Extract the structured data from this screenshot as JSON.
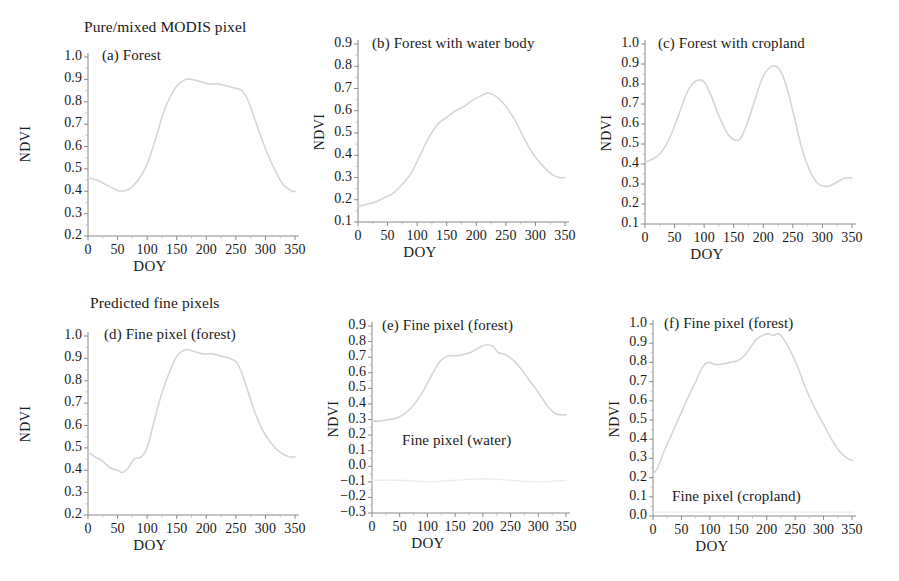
{
  "figure": {
    "row_headings": [
      {
        "text": "Pure/mixed MODIS pixel"
      },
      {
        "text": "Predicted fine pixels"
      }
    ],
    "axis_titles": {
      "x": "DOY",
      "y": "NDVI"
    },
    "curve_color": "#d6d6d6",
    "faint_curve_color": "#ececed",
    "axis_color": "#8a8a8a"
  },
  "chart_data": [
    {
      "type": "line",
      "panel": "a",
      "title": "(a) Forest",
      "xlabel": "DOY",
      "ylabel": "NDVI",
      "xlim": [
        0,
        350
      ],
      "ylim": [
        0.2,
        1.0
      ],
      "xticks": [
        "0",
        "50",
        "100",
        "150",
        "200",
        "250",
        "300",
        "350"
      ],
      "yticks": [
        "0.2",
        "0.3",
        "0.4",
        "0.5",
        "0.6",
        "0.7",
        "0.8",
        "0.9",
        "1.0"
      ],
      "grid": false,
      "legend": "none",
      "series": [
        {
          "name": "Forest",
          "x": [
            0,
            15,
            30,
            45,
            55,
            70,
            85,
            100,
            115,
            125,
            135,
            150,
            165,
            175,
            190,
            205,
            220,
            235,
            250,
            260,
            270,
            285,
            300,
            315,
            330,
            345,
            350
          ],
          "values": [
            0.46,
            0.45,
            0.43,
            0.41,
            0.4,
            0.41,
            0.45,
            0.52,
            0.64,
            0.73,
            0.8,
            0.87,
            0.9,
            0.9,
            0.89,
            0.88,
            0.88,
            0.87,
            0.86,
            0.85,
            0.81,
            0.7,
            0.59,
            0.5,
            0.43,
            0.4,
            0.4
          ]
        }
      ]
    },
    {
      "type": "line",
      "panel": "b",
      "title": "(b) Forest with water body",
      "xlabel": "DOY",
      "ylabel": "NDVI",
      "xlim": [
        0,
        350
      ],
      "ylim": [
        0.1,
        0.9
      ],
      "xticks": [
        "0",
        "50",
        "100",
        "150",
        "200",
        "250",
        "300",
        "350"
      ],
      "yticks": [
        "0.1",
        "0.2",
        "0.3",
        "0.4",
        "0.5",
        "0.6",
        "0.7",
        "0.8",
        "0.9"
      ],
      "grid": false,
      "legend": "none",
      "series": [
        {
          "name": "Forest with water body",
          "x": [
            0,
            15,
            30,
            45,
            60,
            75,
            90,
            105,
            120,
            135,
            150,
            165,
            180,
            195,
            210,
            220,
            230,
            240,
            250,
            265,
            280,
            295,
            310,
            325,
            340,
            350
          ],
          "values": [
            0.17,
            0.18,
            0.19,
            0.21,
            0.23,
            0.27,
            0.32,
            0.4,
            0.48,
            0.54,
            0.57,
            0.6,
            0.62,
            0.65,
            0.67,
            0.68,
            0.67,
            0.65,
            0.62,
            0.56,
            0.48,
            0.41,
            0.36,
            0.32,
            0.3,
            0.3
          ]
        }
      ]
    },
    {
      "type": "line",
      "panel": "c",
      "title": "(c) Forest with cropland",
      "xlabel": "DOY",
      "ylabel": "NDVI",
      "xlim": [
        0,
        350
      ],
      "ylim": [
        0.1,
        1.0
      ],
      "xticks": [
        "0",
        "50",
        "100",
        "150",
        "200",
        "250",
        "300",
        "350"
      ],
      "yticks": [
        "0.1",
        "0.2",
        "0.3",
        "0.4",
        "0.5",
        "0.6",
        "0.7",
        "0.8",
        "0.9",
        "1.0"
      ],
      "grid": false,
      "legend": "none",
      "series": [
        {
          "name": "Forest with cropland",
          "x": [
            0,
            10,
            25,
            40,
            55,
            70,
            80,
            90,
            100,
            112,
            125,
            140,
            152,
            162,
            175,
            190,
            200,
            210,
            220,
            230,
            240,
            252,
            265,
            278,
            290,
            300,
            312,
            325,
            338,
            350
          ],
          "values": [
            0.41,
            0.42,
            0.45,
            0.52,
            0.63,
            0.75,
            0.8,
            0.82,
            0.81,
            0.74,
            0.64,
            0.55,
            0.52,
            0.53,
            0.62,
            0.76,
            0.84,
            0.88,
            0.89,
            0.86,
            0.78,
            0.64,
            0.48,
            0.37,
            0.31,
            0.29,
            0.29,
            0.31,
            0.33,
            0.33
          ]
        }
      ]
    },
    {
      "type": "line",
      "panel": "d",
      "title": "(d) Fine pixel (forest)",
      "xlabel": "DOY",
      "ylabel": "NDVI",
      "xlim": [
        0,
        350
      ],
      "ylim": [
        0.2,
        1.0
      ],
      "xticks": [
        "0",
        "50",
        "100",
        "150",
        "200",
        "250",
        "300",
        "350"
      ],
      "yticks": [
        "0.2",
        "0.3",
        "0.4",
        "0.5",
        "0.6",
        "0.7",
        "0.8",
        "0.9",
        "1.0"
      ],
      "grid": false,
      "legend": "none",
      "series": [
        {
          "name": "Fine pixel (forest)",
          "x": [
            0,
            12,
            25,
            38,
            50,
            58,
            68,
            78,
            90,
            100,
            110,
            122,
            135,
            148,
            158,
            168,
            180,
            195,
            210,
            225,
            240,
            252,
            262,
            272,
            282,
            295,
            310,
            325,
            340,
            350
          ],
          "values": [
            0.48,
            0.46,
            0.44,
            0.41,
            0.4,
            0.39,
            0.41,
            0.45,
            0.46,
            0.5,
            0.6,
            0.72,
            0.82,
            0.9,
            0.93,
            0.94,
            0.93,
            0.92,
            0.92,
            0.91,
            0.9,
            0.88,
            0.82,
            0.74,
            0.66,
            0.58,
            0.52,
            0.48,
            0.46,
            0.46
          ]
        }
      ]
    },
    {
      "type": "line",
      "panel": "e",
      "title": "(e) Fine pixel (forest)",
      "inner_label": "Fine pixel (water)",
      "xlabel": "DOY",
      "ylabel": "NDVI",
      "xlim": [
        0,
        350
      ],
      "ylim": [
        -0.3,
        0.9
      ],
      "xticks": [
        "0",
        "50",
        "100",
        "150",
        "200",
        "250",
        "300",
        "350"
      ],
      "yticks": [
        "-0.3",
        "-0.2",
        "-0.1",
        "0.0",
        "0.1",
        "0.2",
        "0.3",
        "0.4",
        "0.5",
        "0.6",
        "0.7",
        "0.8",
        "0.9"
      ],
      "grid": false,
      "legend": "none",
      "series": [
        {
          "name": "Fine pixel (forest)",
          "x": [
            0,
            15,
            30,
            45,
            60,
            72,
            85,
            98,
            110,
            122,
            132,
            142,
            155,
            168,
            178,
            188,
            198,
            208,
            218,
            228,
            238,
            248,
            258,
            270,
            282,
            295,
            308,
            318,
            330,
            340,
            350
          ],
          "values": [
            0.29,
            0.29,
            0.3,
            0.31,
            0.34,
            0.38,
            0.44,
            0.52,
            0.6,
            0.67,
            0.7,
            0.71,
            0.71,
            0.72,
            0.73,
            0.75,
            0.77,
            0.78,
            0.77,
            0.73,
            0.72,
            0.7,
            0.67,
            0.62,
            0.56,
            0.5,
            0.43,
            0.38,
            0.34,
            0.33,
            0.33
          ]
        },
        {
          "name": "Fine pixel (water)",
          "x": [
            0,
            50,
            100,
            150,
            200,
            250,
            300,
            350
          ],
          "values": [
            -0.09,
            -0.09,
            -0.1,
            -0.09,
            -0.08,
            -0.09,
            -0.1,
            -0.09
          ]
        }
      ]
    },
    {
      "type": "line",
      "panel": "f",
      "title": "(f) Fine pixel (forest)",
      "inner_label": "Fine pixel (cropland)",
      "xlabel": "DOY",
      "ylabel": "NDVI",
      "xlim": [
        0,
        350
      ],
      "ylim": [
        0.0,
        1.0
      ],
      "xticks": [
        "0",
        "50",
        "100",
        "150",
        "200",
        "250",
        "300",
        "350"
      ],
      "yticks": [
        "0.0",
        "0.1",
        "0.2",
        "0.3",
        "0.4",
        "0.5",
        "0.6",
        "0.7",
        "0.8",
        "0.9",
        "1.0"
      ],
      "grid": false,
      "legend": "none",
      "series": [
        {
          "name": "Fine pixel (forest)",
          "x": [
            0,
            8,
            20,
            35,
            50,
            62,
            75,
            88,
            98,
            108,
            120,
            135,
            150,
            162,
            172,
            182,
            192,
            202,
            212,
            220,
            228,
            238,
            248,
            258,
            268,
            280,
            292,
            305,
            318,
            330,
            342,
            350
          ],
          "values": [
            0.22,
            0.25,
            0.34,
            0.44,
            0.54,
            0.62,
            0.7,
            0.78,
            0.8,
            0.79,
            0.79,
            0.8,
            0.81,
            0.84,
            0.88,
            0.92,
            0.94,
            0.95,
            0.94,
            0.95,
            0.93,
            0.88,
            0.82,
            0.75,
            0.67,
            0.59,
            0.52,
            0.45,
            0.38,
            0.33,
            0.3,
            0.29
          ]
        },
        {
          "name": "Fine pixel (cropland)",
          "x": [
            0,
            50,
            100,
            150,
            200,
            250,
            300,
            350
          ],
          "values": [
            0.02,
            0.02,
            0.02,
            0.02,
            0.02,
            0.02,
            0.02,
            0.02
          ]
        }
      ]
    }
  ]
}
